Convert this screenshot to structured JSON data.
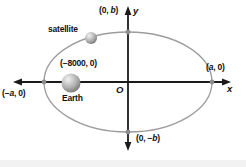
{
  "labels": {
    "satellite": "satellite",
    "earth": "Earth",
    "origin": "O",
    "x_axis": "x",
    "y_axis": "y",
    "earth_coordinate": "(−8000, 0)",
    "top_vertex": {
      "pre": "(0, ",
      "var": "b",
      "post": ")"
    },
    "bottom_vertex": {
      "pre": "(0, −",
      "var": "b",
      "post": ")"
    },
    "right_vertex": {
      "pre": "(",
      "var": "a",
      "post": ", 0)"
    },
    "left_vertex": {
      "pre": "(−",
      "var": "a",
      "post": ", 0)"
    }
  },
  "colors": {
    "axis": "#1a1a1a",
    "ellipse_stroke": "#9c9c9c",
    "vertex_dot": "#8c8c8c",
    "sphere_highlight": "#f2f2f2",
    "sphere_mid": "#b2b2b2",
    "sphere_edge": "#6e6e6e",
    "text": "#111111",
    "footer_strip": "#f2f2f2"
  }
}
